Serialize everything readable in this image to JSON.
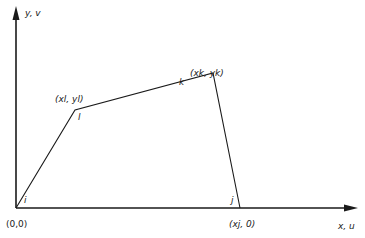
{
  "axes": {
    "y_label": "y, v",
    "x_label": "x, u"
  },
  "nodes": [
    {
      "id": "i",
      "label": "i",
      "coord_label": "(0,0)"
    },
    {
      "id": "l",
      "label": "l",
      "coord_label": "(xl, yl)"
    },
    {
      "id": "k",
      "label": "k",
      "coord_label": "(xk, yk)"
    },
    {
      "id": "j",
      "label": "j",
      "coord_label": "(xj, 0)"
    }
  ],
  "colors": {
    "line": "#1a1a1a",
    "background": "#ffffff"
  }
}
